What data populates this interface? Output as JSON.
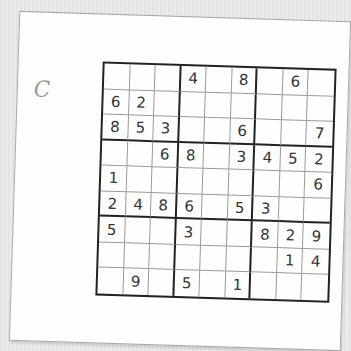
{
  "puzzle": {
    "label": "C",
    "grid": [
      [
        "",
        "",
        "",
        "4",
        "",
        "8",
        "",
        "6",
        ""
      ],
      [
        "6",
        "2",
        "",
        "",
        "",
        "",
        "",
        "",
        ""
      ],
      [
        "8",
        "5",
        "3",
        "",
        "",
        "6",
        "",
        "",
        "7"
      ],
      [
        "",
        "",
        "6",
        "8",
        "",
        "3",
        "4",
        "5",
        "2"
      ],
      [
        "1",
        "",
        "",
        "",
        "",
        "",
        "",
        "",
        "6"
      ],
      [
        "2",
        "4",
        "8",
        "6",
        "",
        "5",
        "3",
        "",
        ""
      ],
      [
        "5",
        "",
        "",
        "3",
        "",
        "",
        "8",
        "2",
        "9"
      ],
      [
        "",
        "",
        "",
        "",
        "",
        "",
        "",
        "1",
        "4"
      ],
      [
        "",
        "9",
        "",
        "5",
        "",
        "1",
        "",
        "",
        ""
      ]
    ]
  },
  "colors": {
    "background": "#e8e8e8",
    "paper": "#fefefe",
    "grid_line_thick": "#222222",
    "grid_line_thin": "#9a9a9a",
    "digit": "#333333",
    "label": "#9a9a9a"
  }
}
